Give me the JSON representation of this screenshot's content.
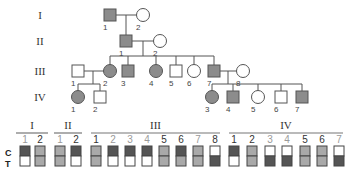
{
  "colors": {
    "affected": "#8c8c8c",
    "unaffected": "#ffffff",
    "outline": "#555555",
    "marker_dark": "#555555",
    "marker_mid": "#a9a9a9",
    "marker_light": "#ffffff",
    "num_gray": "#9a9a9a",
    "num_dark": "#333333"
  },
  "pedigree": {
    "generations": [
      {
        "label": "I",
        "y": 15
      },
      {
        "label": "II",
        "y": 41
      },
      {
        "label": "III",
        "y": 71
      },
      {
        "label": "IV",
        "y": 97
      }
    ],
    "individuals": [
      {
        "id": "I-1",
        "gen": 0,
        "num": "1",
        "sex": "male",
        "affected": true,
        "x": 110
      },
      {
        "id": "I-2",
        "gen": 0,
        "num": "2",
        "sex": "female",
        "affected": false,
        "x": 143
      },
      {
        "id": "II-1",
        "gen": 1,
        "num": "1",
        "sex": "male",
        "affected": true,
        "x": 126
      },
      {
        "id": "II-2",
        "gen": 1,
        "num": "2",
        "sex": "female",
        "affected": false,
        "x": 160
      },
      {
        "id": "III-1",
        "gen": 2,
        "num": "1",
        "sex": "male",
        "affected": false,
        "x": 78
      },
      {
        "id": "III-2",
        "gen": 2,
        "num": "2",
        "sex": "female",
        "affected": true,
        "x": 110
      },
      {
        "id": "III-3",
        "gen": 2,
        "num": "3",
        "sex": "male",
        "affected": true,
        "x": 128
      },
      {
        "id": "III-4",
        "gen": 2,
        "num": "4",
        "sex": "female",
        "affected": true,
        "x": 156
      },
      {
        "id": "III-5",
        "gen": 2,
        "num": "5",
        "sex": "male",
        "affected": false,
        "x": 176
      },
      {
        "id": "III-6",
        "gen": 2,
        "num": "6",
        "sex": "female",
        "affected": false,
        "x": 194
      },
      {
        "id": "III-7",
        "gen": 2,
        "num": "7",
        "sex": "male",
        "affected": true,
        "x": 214
      },
      {
        "id": "III-8",
        "gen": 2,
        "num": "8",
        "sex": "female",
        "affected": false,
        "x": 243
      },
      {
        "id": "IV-1",
        "gen": 3,
        "num": "1",
        "sex": "female",
        "affected": true,
        "x": 78
      },
      {
        "id": "IV-2",
        "gen": 3,
        "num": "2",
        "sex": "male",
        "affected": false,
        "x": 100
      },
      {
        "id": "IV-3",
        "gen": 3,
        "num": "3",
        "sex": "female",
        "affected": true,
        "x": 212
      },
      {
        "id": "IV-4",
        "gen": 3,
        "num": "4",
        "sex": "male",
        "affected": true,
        "x": 233
      },
      {
        "id": "IV-5",
        "gen": 3,
        "num": "5",
        "sex": "female",
        "affected": false,
        "x": 258
      },
      {
        "id": "IV-6",
        "gen": 3,
        "num": "6",
        "sex": "male",
        "affected": false,
        "x": 281
      },
      {
        "id": "IV-7",
        "gen": 3,
        "num": "7",
        "sex": "male",
        "affected": true,
        "x": 302
      }
    ]
  },
  "markers": {
    "row_labels": {
      "top": "C",
      "bottom": "T"
    },
    "groups": [
      {
        "label": "I",
        "x1": 16,
        "x2": 48,
        "items": [
          {
            "num": "1",
            "top": "dark",
            "bottom": "light",
            "num_color": "gray",
            "x": 25
          },
          {
            "num": "2",
            "top": "mid",
            "bottom": "mid",
            "num_color": "dark",
            "x": 40
          }
        ]
      },
      {
        "label": "II",
        "x1": 54,
        "x2": 82,
        "items": [
          {
            "num": "1",
            "top": "mid",
            "bottom": "mid",
            "num_color": "gray",
            "x": 60
          },
          {
            "num": "2",
            "top": "dark",
            "bottom": "light",
            "num_color": "dark",
            "x": 76
          }
        ]
      },
      {
        "label": "III",
        "x1": 91,
        "x2": 220,
        "items": [
          {
            "num": "1",
            "top": "mid",
            "bottom": "mid",
            "num_color": "dark",
            "x": 96
          },
          {
            "num": "2",
            "top": "dark",
            "bottom": "light",
            "num_color": "gray",
            "x": 113
          },
          {
            "num": "3",
            "top": "dark",
            "bottom": "light",
            "num_color": "gray",
            "x": 130
          },
          {
            "num": "4",
            "top": "dark",
            "bottom": "light",
            "num_color": "gray",
            "x": 147
          },
          {
            "num": "5",
            "top": "mid",
            "bottom": "mid",
            "num_color": "dark",
            "x": 164
          },
          {
            "num": "6",
            "top": "dark",
            "bottom": "mid",
            "num_color": "dark",
            "x": 181
          },
          {
            "num": "7",
            "top": "mid",
            "bottom": "mid",
            "num_color": "gray",
            "x": 198
          },
          {
            "num": "8",
            "top": "light",
            "bottom": "dark",
            "num_color": "dark",
            "x": 215
          }
        ]
      },
      {
        "label": "IV",
        "x1": 229,
        "x2": 343,
        "items": [
          {
            "num": "1",
            "top": "dark",
            "bottom": "light",
            "num_color": "dark",
            "x": 234
          },
          {
            "num": "2",
            "top": "mid",
            "bottom": "mid",
            "num_color": "dark",
            "x": 252
          },
          {
            "num": "3",
            "top": "light",
            "bottom": "dark",
            "num_color": "gray",
            "x": 270
          },
          {
            "num": "4",
            "top": "light",
            "bottom": "dark",
            "num_color": "gray",
            "x": 287
          },
          {
            "num": "5",
            "top": "mid",
            "bottom": "mid",
            "num_color": "dark",
            "x": 305
          },
          {
            "num": "6",
            "top": "mid",
            "bottom": "mid",
            "num_color": "dark",
            "x": 322
          },
          {
            "num": "7",
            "top": "light",
            "bottom": "dark",
            "num_color": "gray",
            "x": 339
          }
        ]
      }
    ]
  }
}
